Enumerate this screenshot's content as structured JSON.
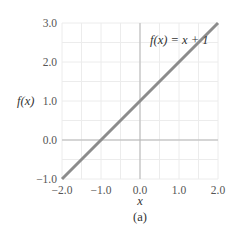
{
  "chart_data": {
    "type": "line",
    "title": "",
    "xlabel": "x",
    "ylabel": "f(x)",
    "caption": "(a)",
    "annotation": "f(x) = x + 1",
    "xlim": [
      -2.0,
      2.0
    ],
    "ylim": [
      -1.0,
      3.0
    ],
    "grid": true,
    "x_ticks": [
      "−2.0",
      "−1.0",
      "0.0",
      "1.0",
      "2.0"
    ],
    "y_ticks": [
      "−1.0",
      "0.0",
      "1.0",
      "2.0",
      "3.0"
    ],
    "series": [
      {
        "name": "f(x) = x + 1",
        "x": [
          -2.0,
          2.0
        ],
        "y": [
          -1.0,
          3.0
        ],
        "color": "#8c8c8c"
      }
    ],
    "colors": {
      "line": "#8c8c8c",
      "axis": "#b5b5b5",
      "grid": "#ececec"
    }
  }
}
